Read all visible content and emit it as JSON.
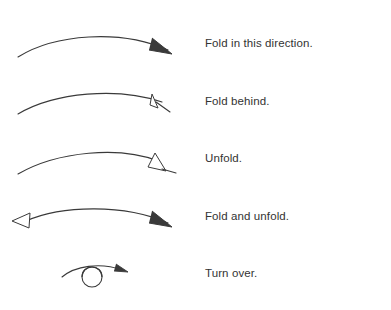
{
  "page": {
    "background_color": "#ffffff",
    "ink_color": "#3a3a3a",
    "text_color": "#333333"
  },
  "legend": {
    "rows": [
      {
        "label": "Fold in this direction.",
        "symbol_name": "arc-arrow-solid-head-right",
        "head_style": "solid-v",
        "direction": "right",
        "double_headed": false
      },
      {
        "label": "Fold behind.",
        "symbol_name": "arc-arrow-small-hollow-head-right",
        "head_style": "hollow-triangle-small",
        "direction": "right",
        "double_headed": false
      },
      {
        "label": "Unfold.",
        "symbol_name": "arc-arrow-large-hollow-head-right",
        "head_style": "hollow-triangle-large",
        "direction": "right",
        "double_headed": false
      },
      {
        "label": "Fold and unfold.",
        "symbol_name": "arc-arrow-double-headed",
        "head_style": "hollow-triangle-left-and-solid-v-right",
        "direction": "both",
        "double_headed": true
      },
      {
        "label": "Turn over.",
        "symbol_name": "turn-over-arc-with-circle",
        "head_style": "solid-v",
        "direction": "right",
        "double_headed": false
      }
    ]
  }
}
